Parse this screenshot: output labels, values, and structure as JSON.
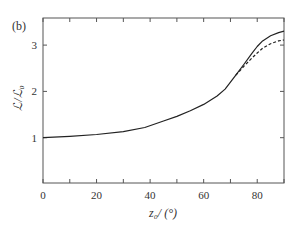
{
  "panel_label": "(b)",
  "chart_data": {
    "type": "line",
    "title": "",
    "xlabel": "z₀/ (°)",
    "ylabel": "ℒ/ℒ₀",
    "xlim": [
      0,
      90
    ],
    "ylim": [
      0,
      3.6
    ],
    "xticks": [
      0,
      20,
      40,
      60,
      80
    ],
    "xticks_minor": [
      10,
      30,
      50,
      70,
      90
    ],
    "yticks": [
      1,
      2,
      3
    ],
    "grid": false,
    "legend": null,
    "series": [
      {
        "name": "solid",
        "style": "solid",
        "x": [
          0,
          10,
          20,
          30,
          38,
          45,
          50,
          55,
          60,
          65,
          68,
          72,
          75,
          78,
          80,
          82,
          85,
          88,
          90
        ],
        "y": [
          1.0,
          1.03,
          1.07,
          1.13,
          1.22,
          1.36,
          1.46,
          1.58,
          1.72,
          1.9,
          2.05,
          2.35,
          2.58,
          2.82,
          2.97,
          3.09,
          3.2,
          3.27,
          3.3
        ]
      },
      {
        "name": "dashed",
        "style": "dashed",
        "x": [
          72,
          75,
          78,
          80,
          82,
          85,
          88,
          90
        ],
        "y": [
          2.35,
          2.54,
          2.72,
          2.83,
          2.93,
          3.03,
          3.09,
          3.11
        ]
      }
    ]
  }
}
